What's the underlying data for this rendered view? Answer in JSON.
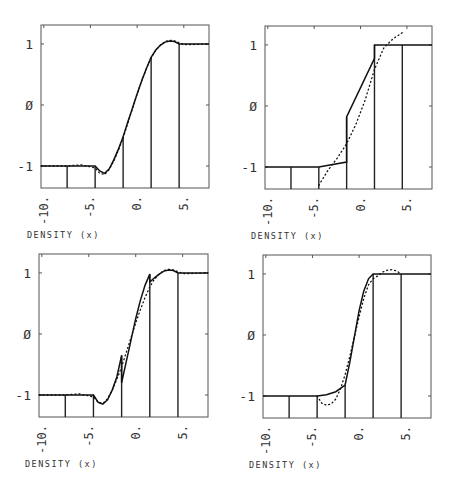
{
  "figure": {
    "xlabel": "DENSITY (x)",
    "xtick_labels": [
      "-10.",
      "-5.",
      "0.",
      "5."
    ],
    "ytick_labels": [
      "1",
      "Ø",
      "-1"
    ]
  },
  "chart_data": [
    {
      "type": "line",
      "panel": "top-left",
      "title": "",
      "xlabel": "DENSITY (x)",
      "ylabel": "",
      "xlim": [
        -10.3,
        7.7
      ],
      "ylim": [
        -1.36,
        1.31
      ],
      "xticks": [
        -10,
        -5,
        0,
        5
      ],
      "xtick_labels": [
        "-10.",
        "-5.",
        "0.",
        "5."
      ],
      "yticks": [
        1,
        0,
        -1
      ],
      "ytick_labels": [
        "1",
        "Ø",
        "-1"
      ],
      "element_boundaries": [
        -7.5,
        -4.5,
        -1.5,
        1.5,
        4.5
      ],
      "series": [
        {
          "name": "approximation",
          "style": "solid",
          "x": [
            -10.3,
            -7.5,
            -4.5,
            -4.0,
            -3.5,
            -3.0,
            -2.5,
            -2.0,
            -1.5,
            -1.0,
            -0.5,
            0.0,
            0.5,
            1.0,
            1.5,
            2.0,
            2.5,
            3.0,
            3.5,
            4.0,
            4.5,
            5.0,
            6.0,
            7.7
          ],
          "y": [
            -1.0,
            -1.0,
            -1.0,
            -1.08,
            -1.12,
            -1.05,
            -0.9,
            -0.72,
            -0.52,
            -0.28,
            -0.05,
            0.18,
            0.4,
            0.6,
            0.78,
            0.9,
            0.98,
            1.03,
            1.05,
            1.04,
            1.0,
            1.0,
            1.0,
            1.0
          ]
        },
        {
          "name": "exact",
          "style": "dotted",
          "x": [
            -10.3,
            -7.5,
            -6.0,
            -4.5,
            -4.0,
            -3.5,
            -3.0,
            -2.5,
            -2.0,
            -1.5,
            -1.0,
            -0.5,
            0.0,
            0.5,
            1.0,
            1.5,
            2.0,
            2.5,
            3.0,
            3.5,
            4.0,
            4.5,
            5.0,
            6.0,
            7.7
          ],
          "y": [
            -1.0,
            -1.0,
            -0.98,
            -1.03,
            -1.12,
            -1.14,
            -1.06,
            -0.92,
            -0.74,
            -0.54,
            -0.3,
            -0.06,
            0.18,
            0.4,
            0.6,
            0.77,
            0.9,
            0.98,
            1.04,
            1.06,
            1.05,
            1.02,
            0.99,
            0.99,
            1.0
          ]
        }
      ]
    },
    {
      "type": "line",
      "panel": "top-right",
      "title": "",
      "xlabel": "DENSITY (x)",
      "ylabel": "",
      "xlim": [
        -10.3,
        7.7
      ],
      "ylim": [
        -1.36,
        1.31
      ],
      "xticks": [
        -10,
        -5,
        0,
        5
      ],
      "xtick_labels": [
        "-10.",
        "-5.",
        "0.",
        "5."
      ],
      "yticks": [
        1,
        0,
        -1
      ],
      "ytick_labels": [
        "1",
        "Ø",
        "-1"
      ],
      "element_boundaries": [
        -7.5,
        -4.5,
        -1.5,
        1.5,
        4.5
      ],
      "series": [
        {
          "name": "approximation",
          "style": "solid",
          "x": [
            -10.3,
            -7.5,
            -4.5,
            -1.5,
            -1.5,
            1.5,
            1.5,
            4.5,
            7.7
          ],
          "y": [
            -1.0,
            -1.0,
            -1.0,
            -0.92,
            -0.18,
            0.78,
            1.0,
            1.0,
            1.0
          ]
        },
        {
          "name": "exact",
          "style": "dotted",
          "x": [
            -4.5,
            -3.5,
            -2.5,
            -1.5,
            -0.5,
            0.5,
            1.5,
            2.5,
            3.5,
            4.5
          ],
          "y": [
            -1.3,
            -1.05,
            -0.85,
            -0.62,
            -0.3,
            0.1,
            0.6,
            0.95,
            1.1,
            1.2
          ]
        }
      ]
    },
    {
      "type": "line",
      "panel": "bottom-left",
      "title": "",
      "xlabel": "DENSITY (x)",
      "ylabel": "",
      "xlim": [
        -10.3,
        7.7
      ],
      "ylim": [
        -1.36,
        1.31
      ],
      "xticks": [
        -10,
        -5,
        0,
        5
      ],
      "xtick_labels": [
        "-10.",
        "-5.",
        "0.",
        "5."
      ],
      "yticks": [
        1,
        0,
        -1
      ],
      "ytick_labels": [
        "1",
        "Ø",
        "-1"
      ],
      "element_boundaries": [
        -7.5,
        -4.5,
        -1.5,
        1.5,
        4.5
      ],
      "series": [
        {
          "name": "approximation",
          "style": "solid",
          "x": [
            -10.3,
            -7.5,
            -4.5,
            -4.0,
            -3.5,
            -3.0,
            -2.5,
            -2.0,
            -1.5,
            -1.5,
            -1.0,
            -0.5,
            0.0,
            0.5,
            1.0,
            1.5,
            1.5,
            2.0,
            2.5,
            3.0,
            3.5,
            4.0,
            4.5,
            5.0,
            6.0,
            7.7
          ],
          "y": [
            -1.0,
            -1.0,
            -1.0,
            -1.12,
            -1.15,
            -1.08,
            -0.92,
            -0.7,
            -0.35,
            -0.8,
            -0.45,
            -0.1,
            0.25,
            0.55,
            0.8,
            0.98,
            0.85,
            0.92,
            0.98,
            1.03,
            1.05,
            1.04,
            1.0,
            1.0,
            1.0,
            1.0
          ]
        },
        {
          "name": "exact",
          "style": "dotted",
          "x": [
            -10.3,
            -7.5,
            -6.0,
            -4.5,
            -4.0,
            -3.5,
            -3.0,
            -2.5,
            -2.0,
            -1.5,
            -1.0,
            -0.5,
            0.0,
            0.5,
            1.0,
            1.5,
            2.0,
            2.5,
            3.0,
            3.5,
            4.0,
            4.5,
            5.0,
            6.0,
            7.7
          ],
          "y": [
            -1.0,
            -1.0,
            -0.98,
            -1.03,
            -1.12,
            -1.14,
            -1.06,
            -0.92,
            -0.74,
            -0.54,
            -0.3,
            -0.06,
            0.18,
            0.4,
            0.6,
            0.77,
            0.9,
            0.98,
            1.04,
            1.06,
            1.05,
            1.02,
            0.99,
            0.99,
            1.0
          ]
        }
      ]
    },
    {
      "type": "line",
      "panel": "bottom-right",
      "title": "",
      "xlabel": "DENSITY (x)",
      "ylabel": "",
      "xlim": [
        -10.3,
        7.7
      ],
      "ylim": [
        -1.36,
        1.31
      ],
      "xticks": [
        -10,
        -5,
        0,
        5
      ],
      "xtick_labels": [
        "-10.",
        "-5.",
        "0.",
        "5."
      ],
      "yticks": [
        1,
        0,
        -1
      ],
      "ytick_labels": [
        "1",
        "Ø",
        "-1"
      ],
      "element_boundaries": [
        -7.5,
        -4.5,
        -1.5,
        1.5,
        4.5
      ],
      "series": [
        {
          "name": "approximation",
          "style": "solid",
          "x": [
            -10.3,
            -7.5,
            -4.5,
            -3.5,
            -2.5,
            -1.5,
            -1.0,
            -0.5,
            0.0,
            0.5,
            1.0,
            1.5,
            2.5,
            4.5,
            7.7
          ],
          "y": [
            -1.0,
            -1.0,
            -1.0,
            -0.98,
            -0.93,
            -0.82,
            -0.45,
            -0.02,
            0.4,
            0.72,
            0.92,
            1.0,
            1.0,
            1.0,
            1.0
          ]
        },
        {
          "name": "exact",
          "style": "dotted",
          "x": [
            -4.5,
            -4.0,
            -3.5,
            -3.0,
            -2.5,
            -2.0,
            -1.5,
            -1.0,
            -0.5,
            0.0,
            0.5,
            1.0,
            1.5,
            2.0,
            2.5,
            3.0,
            3.5,
            4.0,
            4.5
          ],
          "y": [
            -1.0,
            -1.12,
            -1.15,
            -1.13,
            -1.05,
            -0.88,
            -0.65,
            -0.35,
            -0.02,
            0.3,
            0.6,
            0.82,
            0.92,
            0.97,
            1.03,
            1.06,
            1.07,
            1.05,
            1.0
          ]
        }
      ]
    }
  ]
}
